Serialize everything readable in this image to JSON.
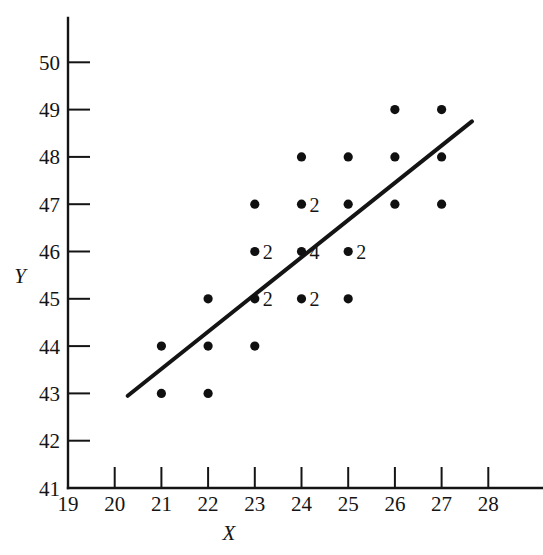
{
  "chart_data": {
    "type": "scatter",
    "title": "",
    "subtitle": "",
    "xlabel": "X",
    "ylabel": "Y",
    "xlim": [
      19,
      28.6
    ],
    "ylim": [
      41,
      50.6
    ],
    "grid": false,
    "legend": "none",
    "x_ticks": [
      19,
      20,
      21,
      22,
      23,
      24,
      25,
      26,
      27,
      28
    ],
    "y_ticks": [
      41,
      42,
      43,
      44,
      45,
      46,
      47,
      48,
      49,
      50
    ],
    "x_tick_labels": [
      "19",
      "20",
      "21",
      "22",
      "23",
      "24",
      "25",
      "26",
      "27",
      "28"
    ],
    "y_tick_labels": [
      "41",
      "42",
      "43",
      "44",
      "45",
      "46",
      "47",
      "48",
      "49",
      "50"
    ],
    "point_count_annotation_note": "number beside a dot = count of coincident observations at that (x,y); dots without a number represent 1 observation",
    "points": [
      {
        "x": 21,
        "y": 44,
        "count": 1,
        "label": ""
      },
      {
        "x": 21,
        "y": 43,
        "count": 1,
        "label": ""
      },
      {
        "x": 22,
        "y": 45,
        "count": 1,
        "label": ""
      },
      {
        "x": 22,
        "y": 44,
        "count": 1,
        "label": ""
      },
      {
        "x": 22,
        "y": 43,
        "count": 1,
        "label": ""
      },
      {
        "x": 23,
        "y": 47,
        "count": 1,
        "label": ""
      },
      {
        "x": 23,
        "y": 46,
        "count": 2,
        "label": "2"
      },
      {
        "x": 23,
        "y": 45,
        "count": 2,
        "label": "2"
      },
      {
        "x": 23,
        "y": 44,
        "count": 1,
        "label": ""
      },
      {
        "x": 24,
        "y": 48,
        "count": 1,
        "label": ""
      },
      {
        "x": 24,
        "y": 47,
        "count": 2,
        "label": "2"
      },
      {
        "x": 24,
        "y": 46,
        "count": 4,
        "label": "4"
      },
      {
        "x": 24,
        "y": 45,
        "count": 2,
        "label": "2"
      },
      {
        "x": 25,
        "y": 48,
        "count": 1,
        "label": ""
      },
      {
        "x": 25,
        "y": 47,
        "count": 1,
        "label": ""
      },
      {
        "x": 25,
        "y": 46,
        "count": 2,
        "label": "2"
      },
      {
        "x": 25,
        "y": 45,
        "count": 1,
        "label": ""
      },
      {
        "x": 26,
        "y": 49,
        "count": 1,
        "label": ""
      },
      {
        "x": 26,
        "y": 48,
        "count": 1,
        "label": ""
      },
      {
        "x": 26,
        "y": 47,
        "count": 1,
        "label": ""
      },
      {
        "x": 27,
        "y": 49,
        "count": 1,
        "label": ""
      },
      {
        "x": 27,
        "y": 48,
        "count": 1,
        "label": ""
      },
      {
        "x": 27,
        "y": 47,
        "count": 1,
        "label": ""
      }
    ],
    "fit_line": {
      "type": "line",
      "x": [
        20.28,
        27.65
      ],
      "y": [
        42.95,
        48.75
      ]
    }
  }
}
